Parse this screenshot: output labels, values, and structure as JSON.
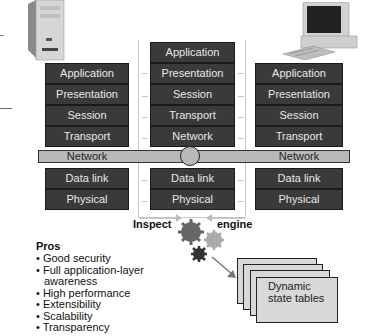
{
  "left_host": {
    "icon": "server-tower-icon",
    "layers": [
      "Application",
      "Presentation",
      "Session",
      "Transport",
      "Network",
      "Data link",
      "Physical"
    ]
  },
  "firewall": {
    "layers_upper": [
      "Application",
      "Presentation",
      "Session",
      "Transport",
      "Network"
    ],
    "layers_lower": [
      "Data link",
      "Physical"
    ]
  },
  "right_host": {
    "icon": "desktop-computer-icon",
    "layers": [
      "Application",
      "Presentation",
      "Session",
      "Transport",
      "Network",
      "Data link",
      "Physical"
    ]
  },
  "inspect_engine": {
    "label_left": "Inspect",
    "label_right": "engine",
    "icon": "gears-icon"
  },
  "state_tables": {
    "label_line1": "Dynamic",
    "label_line2": "state tables"
  },
  "pros": {
    "title": "Pros",
    "items": [
      "Good security",
      "Full application-layer awareness",
      "High performance",
      "Extensibility",
      "Scalability",
      "Transparency"
    ]
  },
  "colors": {
    "layer_fill": "#3a3a3a",
    "network_bar": "#b9b9b9",
    "gear_dark": "#555555",
    "gear_mid": "#888888",
    "gear_light": "#aaaaaa",
    "table_fill": "#d8d8d8"
  }
}
